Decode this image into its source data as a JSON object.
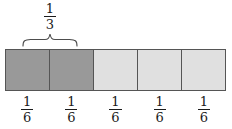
{
  "figure": {
    "width": 232,
    "height": 129,
    "background": "#ffffff"
  },
  "brace": {
    "label_numerator": "1",
    "label_denominator": "3",
    "label_text": "1/3",
    "spans_cells": 2,
    "color": "#4d4d4d"
  },
  "bar": {
    "total_cells": 5,
    "shaded_count": 2,
    "colors": {
      "shaded": "#999999",
      "unshaded": "#e0e0e0",
      "outline": "#555555"
    },
    "cells": [
      {
        "index": 1,
        "state": "shaded",
        "fill": "#999999",
        "label_numerator": "1",
        "label_denominator": "6",
        "label_text": "1/6"
      },
      {
        "index": 2,
        "state": "shaded",
        "fill": "#999999",
        "label_numerator": "1",
        "label_denominator": "6",
        "label_text": "1/6"
      },
      {
        "index": 3,
        "state": "unshaded",
        "fill": "#e0e0e0",
        "label_numerator": "1",
        "label_denominator": "6",
        "label_text": "1/6"
      },
      {
        "index": 4,
        "state": "unshaded",
        "fill": "#e0e0e0",
        "label_numerator": "1",
        "label_denominator": "6",
        "label_text": "1/6"
      },
      {
        "index": 5,
        "state": "unshaded",
        "fill": "#e0e0e0",
        "label_numerator": "1",
        "label_denominator": "6",
        "label_text": "1/6"
      }
    ]
  }
}
